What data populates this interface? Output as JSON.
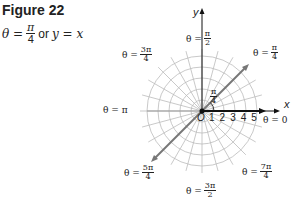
{
  "figure": {
    "title": "Figure 22",
    "equation": {
      "theta": "θ =",
      "num": "π",
      "den": "4",
      "or": "or",
      "rhs": "y = x"
    }
  },
  "axes": {
    "x_label": "x",
    "y_label": "y",
    "origin_label": "O",
    "radial_ticks": [
      "1",
      "2",
      "3",
      "4",
      "5"
    ]
  },
  "angle_marker": {
    "num": "π",
    "den": "4"
  },
  "labels": {
    "theta_0": {
      "text": "θ = 0"
    },
    "theta_pi_4": {
      "prefix": "θ =",
      "num": "π",
      "den": "4"
    },
    "theta_pi_2": {
      "prefix": "θ =",
      "num": "π",
      "den": "2"
    },
    "theta_3pi_4": {
      "prefix": "θ =",
      "num": "3π",
      "den": "4"
    },
    "theta_pi": {
      "text": "θ = π"
    },
    "theta_5pi_4": {
      "prefix": "θ =",
      "num": "5π",
      "den": "4"
    },
    "theta_3pi_2": {
      "prefix": "θ =",
      "num": "3π",
      "den": "2"
    },
    "theta_7pi_4": {
      "prefix": "θ =",
      "num": "7π",
      "den": "4"
    }
  },
  "colors": {
    "grid": "#bbbbbb",
    "line": "#777777",
    "axis": "#111111"
  }
}
